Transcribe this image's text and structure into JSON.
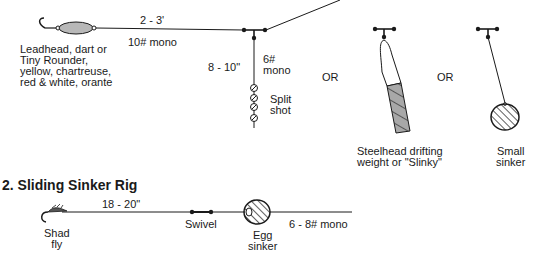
{
  "rig1": {
    "lure_label": [
      "Leadhead, dart or",
      "Tiny Rounder,",
      "yellow, chartreuse,",
      "red & white, orante"
    ],
    "leader_length": "2 - 3'",
    "leader_line": "10# mono",
    "dropper_length": "8 - 10\"",
    "dropper_line": [
      "6#",
      "mono"
    ],
    "split_shot_label": [
      "Split",
      "shot"
    ],
    "or_1": "OR",
    "or_2": "OR",
    "slinky_label": [
      "Steelhead drifting",
      "weight or \"Slinky\""
    ],
    "small_sinker_label": [
      "Small",
      "sinker"
    ]
  },
  "rig2": {
    "title": "2. Sliding Sinker Rig",
    "leader_length": "18 - 20\"",
    "fly_label": [
      "Shad",
      "fly"
    ],
    "swivel_label": "Swivel",
    "sinker_label": [
      "Egg",
      "sinker"
    ],
    "main_line": "6 - 8# mono"
  },
  "colors": {
    "line": "#1a1a1a",
    "lure_fill": "#b8b8b8",
    "weight_fill": "#a8a8a8"
  }
}
